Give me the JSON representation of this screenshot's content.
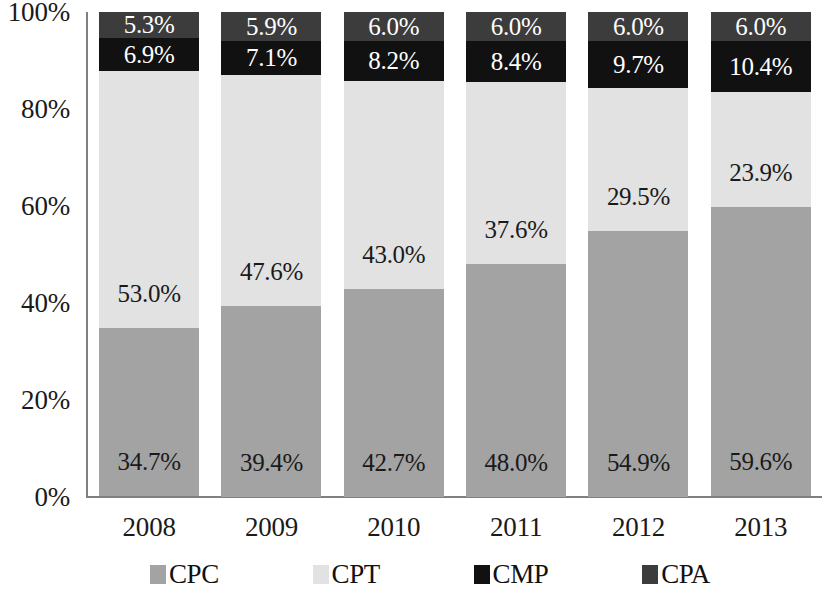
{
  "chart_data": {
    "type": "bar",
    "subtype": "stacked-percentage",
    "title": "",
    "subtitle": "",
    "xlabel": "",
    "ylabel": "",
    "categories": [
      "2008",
      "2009",
      "2010",
      "2011",
      "2012",
      "2013"
    ],
    "ylim": [
      0,
      100
    ],
    "y_ticks": [
      "0%",
      "20%",
      "40%",
      "60%",
      "80%",
      "100%"
    ],
    "y_tick_values": [
      0,
      20,
      40,
      60,
      80,
      100
    ],
    "grid": false,
    "legend_position": "bottom",
    "stack_order_bottom_to_top": [
      "CPC",
      "CPT",
      "CMP",
      "CPA"
    ],
    "series": [
      {
        "name": "CPC",
        "color": "#a3a3a3",
        "label_color": "#1a1a1a",
        "values": [
          34.7,
          39.4,
          42.7,
          48.0,
          54.9,
          59.6
        ],
        "labels": [
          "34.7%",
          "39.4%",
          "42.7%",
          "48.0%",
          "54.9%",
          "59.6%"
        ]
      },
      {
        "name": "CPT",
        "color": "#e2e2e2",
        "label_color": "#1a1a1a",
        "values": [
          53.0,
          47.6,
          43.0,
          37.6,
          29.5,
          23.9
        ],
        "labels": [
          "53.0%",
          "47.6%",
          "43.0%",
          "37.6%",
          "29.5%",
          "23.9%"
        ]
      },
      {
        "name": "CMP",
        "color": "#111111",
        "label_color": "#ffffff",
        "values": [
          6.9,
          7.1,
          8.2,
          8.4,
          9.7,
          10.4
        ],
        "labels": [
          "6.9%",
          "7.1%",
          "8.2%",
          "8.4%",
          "9.7%",
          "10.4%"
        ]
      },
      {
        "name": "CPA",
        "color": "#3c3c3c",
        "label_color": "#ffffff",
        "values": [
          5.3,
          5.9,
          6.0,
          6.0,
          6.0,
          6.0
        ],
        "labels": [
          "5.3%",
          "5.9%",
          "6.0%",
          "6.0%",
          "6.0%",
          "6.0%"
        ]
      }
    ],
    "legend": [
      {
        "label": "CPC",
        "color": "#a3a3a3"
      },
      {
        "label": "CPT",
        "color": "#e2e2e2"
      },
      {
        "label": "CMP",
        "color": "#111111"
      },
      {
        "label": "CPA",
        "color": "#3c3c3c"
      }
    ]
  }
}
